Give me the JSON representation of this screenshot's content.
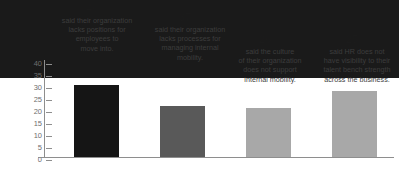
{
  "chart_data": {
    "type": "bar",
    "title": "",
    "xlabel": "",
    "ylabel": "",
    "ylim": [
      0,
      40
    ],
    "yticks": [
      40,
      35,
      30,
      25,
      20,
      15,
      10,
      5,
      0
    ],
    "grid": false,
    "legend": "none",
    "categories": [
      "said their organization lacks positions for employees to move into.",
      "said their organization lacks processes for managing internal mobility.",
      "said the culture of their organization does not support internal mobility.",
      "said HR does not have visibility to their talent bench strength across the business."
    ],
    "values": [
      40,
      37,
      26,
      25
    ],
    "value_labels": [
      "40%",
      "37%",
      "26%",
      "25%"
    ],
    "bar_colors": [
      "#1a1a1a",
      "#151515",
      "#595959",
      "#a8a8a8"
    ]
  },
  "bars": [
    {
      "pct": "40%",
      "caption": "said their organization\nlacks positions for\nemployees to\nmove into.",
      "color": "#1a1a1a"
    },
    {
      "pct": "37%",
      "caption": "said their organization\nlacks processes for\nmanaging internal\nmobility.",
      "color": "#151515"
    },
    {
      "pct": "26%",
      "caption": "said the culture\nof their organization\ndoes not support\ninternal mobility.",
      "color": "#595959"
    },
    {
      "pct": "25%",
      "caption": "said HR does not\nhave visibility to their\ntalent bench strength\nacross the business.",
      "color": "#a8a8a8"
    }
  ],
  "axis": {
    "ticks": [
      "40",
      "35",
      "30",
      "25",
      "20",
      "15",
      "10",
      "5",
      "0"
    ]
  }
}
